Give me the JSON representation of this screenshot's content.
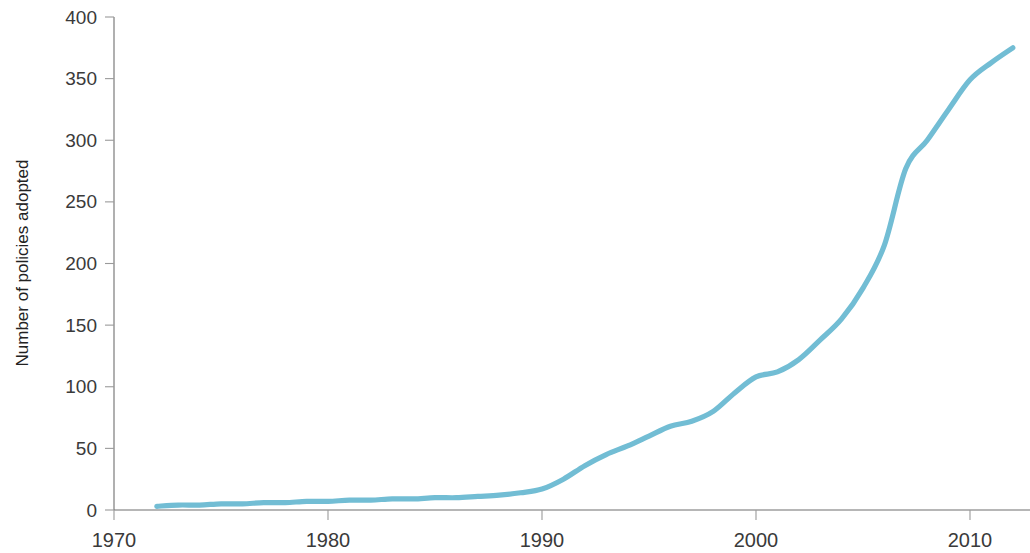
{
  "chart_data": {
    "type": "line",
    "title": "",
    "xlabel": "",
    "ylabel": "Number of policies adopted",
    "xlim": [
      1970,
      2013
    ],
    "ylim": [
      0,
      400
    ],
    "grid": false,
    "legend": null,
    "line_color": "#72bdd4",
    "x_ticks": [
      1970,
      1980,
      1990,
      2000,
      2010
    ],
    "x_tick_labels": [
      "1970",
      "1980",
      "1990",
      "2000",
      "2010"
    ],
    "y_ticks": [
      0,
      50,
      100,
      150,
      200,
      250,
      300,
      350,
      400
    ],
    "y_tick_labels": [
      "0",
      "50",
      "100",
      "150",
      "200",
      "250",
      "300",
      "350",
      "400"
    ],
    "series": [
      {
        "name": "Number of policies adopted",
        "x": [
          1972,
          1973,
          1974,
          1975,
          1976,
          1977,
          1978,
          1979,
          1980,
          1981,
          1982,
          1983,
          1984,
          1985,
          1986,
          1987,
          1988,
          1989,
          1990,
          1991,
          1992,
          1993,
          1994,
          1995,
          1996,
          1997,
          1998,
          1999,
          2000,
          2001,
          2002,
          2003,
          2004,
          2005,
          2006,
          2007,
          2008,
          2009,
          2010,
          2011,
          2012
        ],
        "values": [
          3,
          4,
          4,
          5,
          5,
          6,
          6,
          7,
          7,
          8,
          8,
          9,
          9,
          10,
          10,
          11,
          12,
          14,
          17,
          25,
          36,
          45,
          52,
          60,
          68,
          72,
          80,
          95,
          108,
          112,
          122,
          138,
          155,
          180,
          215,
          277,
          300,
          325,
          349,
          363,
          375
        ]
      }
    ]
  }
}
